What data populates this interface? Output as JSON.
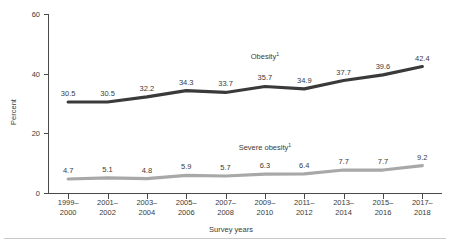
{
  "chart_data": {
    "type": "line",
    "title": "",
    "xlabel": "Survey years",
    "ylabel": "Percent",
    "ylim": [
      0,
      60
    ],
    "yticks": [
      0,
      20,
      40,
      60
    ],
    "grid": false,
    "legend_position": "inline-above-series",
    "categories": [
      "1999–\n2000",
      "2001–\n2002",
      "2003–\n2004",
      "2005–\n2006",
      "2007–\n2008",
      "2009–\n2010",
      "2011–\n2012",
      "2013–\n2014",
      "2015–\n2016",
      "2017–\n2018"
    ],
    "category_lines": [
      [
        "1999–",
        "2000"
      ],
      [
        "2001–",
        "2002"
      ],
      [
        "2003–",
        "2004"
      ],
      [
        "2005–",
        "2006"
      ],
      [
        "2007–",
        "2008"
      ],
      [
        "2009–",
        "2010"
      ],
      [
        "2011–",
        "2012"
      ],
      [
        "2013–",
        "2014"
      ],
      [
        "2015–",
        "2016"
      ],
      [
        "2017–",
        "2018"
      ]
    ],
    "series": [
      {
        "name": "Obesity",
        "footnote_marker": "1",
        "color": "#3a3a3a",
        "values": [
          30.5,
          30.5,
          32.2,
          34.3,
          33.7,
          35.7,
          34.9,
          37.7,
          39.6,
          42.4
        ],
        "value_labels": [
          "30.5",
          "30.5",
          "32.2",
          "34.3",
          "33.7",
          "35.7",
          "34.9",
          "37.7",
          "39.6",
          "42.4"
        ],
        "inline_label": "Obesity",
        "inline_label_category_index": 5
      },
      {
        "name": "Severe obesity",
        "footnote_marker": "1",
        "color": "#a8a8a8",
        "values": [
          4.7,
          5.1,
          4.8,
          5.9,
          5.7,
          6.3,
          6.4,
          7.7,
          7.7,
          9.2
        ],
        "value_labels": [
          "4.7",
          "5.1",
          "4.8",
          "5.9",
          "5.7",
          "6.3",
          "6.4",
          "7.7",
          "7.7",
          "9.2"
        ],
        "inline_label": "Severe obesity",
        "inline_label_category_index": 5
      }
    ]
  },
  "axis": {
    "y_title": "Percent",
    "x_title": "Survey years",
    "y_tick_labels": [
      "0",
      "20",
      "40",
      "60"
    ]
  },
  "colors": {
    "obesity_line": "#3a3a3a",
    "severe_obesity_line": "#a8a8a8",
    "axis": "#4a4a4a",
    "text": "#3b3b3b",
    "background": "#ffffff",
    "rule": "#c9c9c9"
  }
}
